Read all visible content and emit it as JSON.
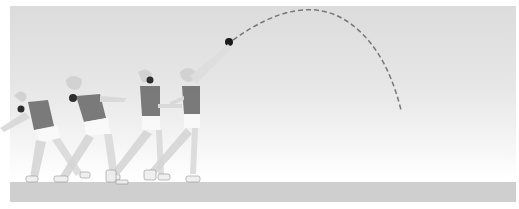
{
  "scene": {
    "description": "Shot put throwing sequence illustration, grayscale",
    "athlete_poses": 4,
    "shot_trajectory": "dashed parabolic arc",
    "colors": {
      "sky_top": "#dcdcdc",
      "ground": "#cfcfcf",
      "singlet": "#6e6e6e",
      "skin": "#d8d8d8",
      "shorts": "#ffffff",
      "shot": "#1a1a1a",
      "trajectory": "#777777"
    }
  }
}
